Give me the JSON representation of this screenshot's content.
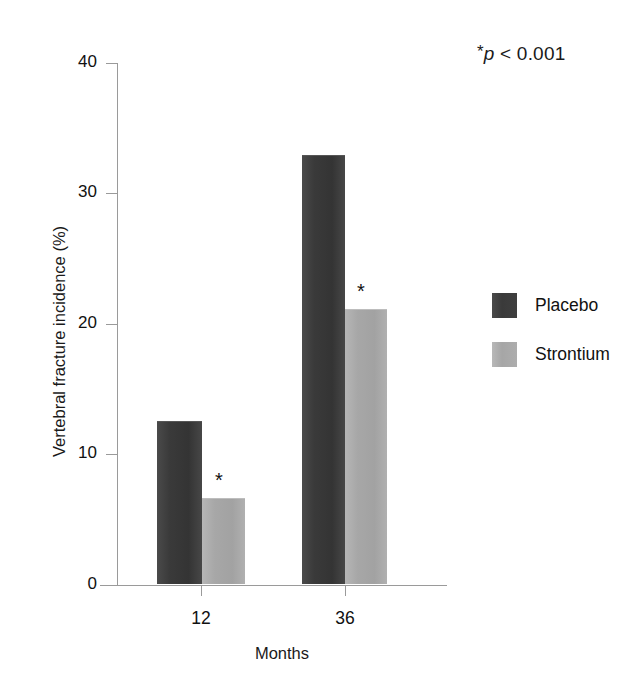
{
  "chart_data": {
    "type": "bar",
    "title": "",
    "xlabel": "Months",
    "ylabel": "Vertebral fracture incidence (%)",
    "categories": [
      "12",
      "36"
    ],
    "series": [
      {
        "name": "Placebo",
        "values": [
          12.4,
          32.8
        ],
        "color": "#3b3b3b"
      },
      {
        "name": "Strontium",
        "values": [
          6.5,
          21.0
        ],
        "color": "#a8a8a8"
      }
    ],
    "ylim": [
      0,
      40
    ],
    "yticks": [
      0,
      10,
      20,
      30,
      40
    ],
    "ytick_labels": [
      "0",
      "10",
      "20",
      "30",
      "40"
    ],
    "grid": false,
    "legend_position": "right",
    "annotations": [
      {
        "name": "significance-note",
        "star": "*",
        "text_italic": "p",
        "text": " < 0.001"
      },
      {
        "name": "bar-significance-marker",
        "text": "*",
        "applies_to": "Strontium",
        "categories": [
          "12",
          "36"
        ]
      }
    ]
  },
  "axes": {
    "y_title": "Vertebral fracture incidence (%)",
    "x_title": "Months",
    "y_tick_labels": [
      "40",
      "30",
      "20",
      "10",
      "0"
    ],
    "x_tick_labels": [
      "12",
      "36"
    ]
  },
  "legend": {
    "items": [
      {
        "label": "Placebo",
        "swatch": "dark-gray-swatch"
      },
      {
        "label": "Strontium",
        "swatch": "light-gray-swatch"
      }
    ]
  },
  "annotation": {
    "star": "*",
    "p_italic": "p",
    "p_rest": " < 0.001"
  },
  "markers": {
    "star_12": "*",
    "star_36": "*"
  }
}
